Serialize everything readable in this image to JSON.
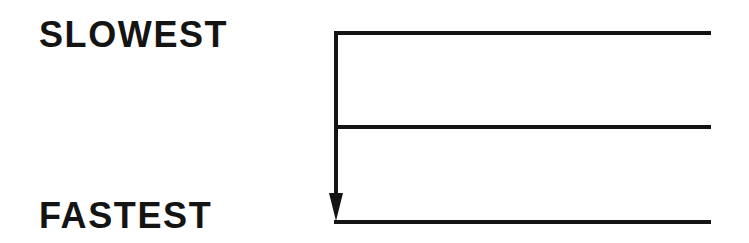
{
  "diagram": {
    "labels": {
      "top": "SLOWEST",
      "bottom": "FASTEST"
    },
    "axis": {
      "direction": "down",
      "meaning": "speed ordering from slowest (top) to fastest (bottom)"
    },
    "levels": [
      {
        "position": "top",
        "y": 33
      },
      {
        "position": "middle",
        "y": 127
      },
      {
        "position": "bottom",
        "y": 222
      }
    ],
    "colors": {
      "line": "#141414",
      "text": "#141414",
      "background": "#ffffff"
    }
  }
}
